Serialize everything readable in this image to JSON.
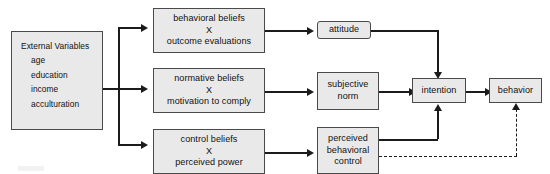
{
  "diagram": {
    "type": "flowchart",
    "palette": {
      "node_fill": "#e9e9e9",
      "node_border": "#4a4a4a",
      "connector": "#1b1b1b",
      "background": "#ffffff"
    },
    "nodes": {
      "external_variables": {
        "heading": "External Variables",
        "items": [
          "age",
          "education",
          "income",
          "acculturation"
        ]
      },
      "behavioral_beliefs": {
        "line1": "behavioral beliefs",
        "line2": "X",
        "line3": "outcome evaluations"
      },
      "normative_beliefs": {
        "line1": "normative beliefs",
        "line2": "X",
        "line3": "motivation to comply"
      },
      "control_beliefs": {
        "line1": "control beliefs",
        "line2": "X",
        "line3": "perceived power"
      },
      "attitude": {
        "label": "attitude"
      },
      "subjective_norm": {
        "line1": "subjective",
        "line2": "norm"
      },
      "perceived_behavioral_control": {
        "line1": "perceived",
        "line2": "behavioral",
        "line3": "control"
      },
      "intention": {
        "label": "intention"
      },
      "behavior": {
        "label": "behavior"
      }
    },
    "edges": [
      {
        "from": "external_variables",
        "to": "behavioral_beliefs",
        "style": "solid"
      },
      {
        "from": "external_variables",
        "to": "normative_beliefs",
        "style": "solid"
      },
      {
        "from": "external_variables",
        "to": "control_beliefs",
        "style": "solid"
      },
      {
        "from": "behavioral_beliefs",
        "to": "attitude",
        "style": "solid"
      },
      {
        "from": "normative_beliefs",
        "to": "subjective_norm",
        "style": "solid"
      },
      {
        "from": "control_beliefs",
        "to": "perceived_behavioral_control",
        "style": "solid"
      },
      {
        "from": "attitude",
        "to": "intention",
        "style": "solid"
      },
      {
        "from": "subjective_norm",
        "to": "intention",
        "style": "solid"
      },
      {
        "from": "perceived_behavioral_control",
        "to": "intention",
        "style": "solid"
      },
      {
        "from": "intention",
        "to": "behavior",
        "style": "solid"
      },
      {
        "from": "perceived_behavioral_control",
        "to": "behavior",
        "style": "dashed"
      }
    ]
  }
}
